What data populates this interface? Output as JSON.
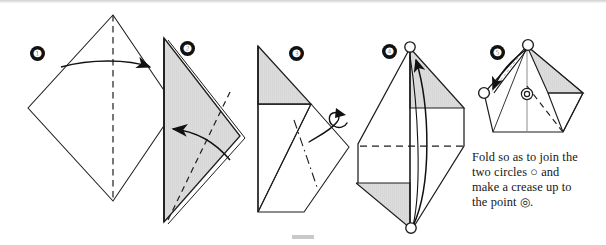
{
  "document": {
    "kind": "origami-fold-instruction-diagram",
    "background_color": "#ffffff",
    "ink_color": "#1a1a1a",
    "shade_color": "#d9d9d9",
    "width": 606,
    "height": 245
  },
  "rules": {
    "top_rule_label": "page-top-rule",
    "bottom_mark_label": "page-bottom-mark"
  },
  "steps": [
    {
      "number": "❶",
      "plain_number": "1",
      "badge_x": 30,
      "badge_y": 46,
      "title": "step-1-square-diamond",
      "description": "Square sheet shown as a diamond with a vertical dashed valley-fold line and a straight arrow folding the left half to the right."
    },
    {
      "number": "❷",
      "plain_number": "2",
      "badge_x": 180,
      "badge_y": 41,
      "title": "step-2-folded-triangle",
      "description": "Shaded triangle pointing right with a dashed diagonal crease and a curved arrow folding the flap back to the left."
    },
    {
      "number": "❸",
      "plain_number": "3",
      "badge_x": 289,
      "badge_y": 46,
      "title": "step-3-rotate",
      "description": "Shaded top triangle with an unfolded tilted square below and a small curl arrow indicating a twist / turn."
    },
    {
      "number": "❹",
      "plain_number": "4",
      "badge_x": 382,
      "badge_y": 44,
      "title": "step-4-tall-form",
      "description": "Tall narrow form with shaded triangles at upper-right and lower-left, open circles marking the top and bottom points, a horizontal dashed crease and a long curved arrow from the bottom circle up to the top circle."
    },
    {
      "number": "❺",
      "plain_number": "5",
      "badge_x": 490,
      "badge_y": 45,
      "title": "step-5-join-circles",
      "description": "Pentagon-like result with an open circle at the apex, an open circle at the left point, a double circle at the centre, and a curved arrow joining apex to left circle."
    }
  ],
  "markers": {
    "circle_glyph": "○",
    "double_circle_glyph": "◎",
    "circle_name": "open-circle-marker",
    "double_circle_name": "double-circle-marker"
  },
  "caption": {
    "line1": "Fold so as to join the",
    "line2_a": "two circles",
    "line2_circle": "○",
    "line2_b": "and",
    "line3": "make a crease up to",
    "line4_a": "the point",
    "line4_circle": "◎",
    "line4_b": ".",
    "full_text": "Fold so as to join the two circles ○ and make a crease up to the point ◎."
  }
}
